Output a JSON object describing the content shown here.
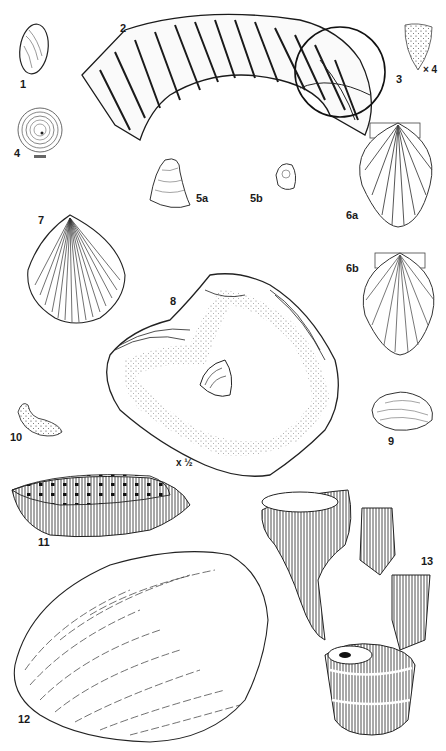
{
  "plate": {
    "background": "#ffffff",
    "ink": "#1a1a1a",
    "figures": [
      {
        "id": "1",
        "label": "1",
        "kind": "oval bivalve shell"
      },
      {
        "id": "2",
        "label": "2",
        "kind": "ribbed ammonite fragment"
      },
      {
        "id": "3",
        "label": "3",
        "kind": "tooth-like fragment",
        "scale": "× 4"
      },
      {
        "id": "4",
        "label": "4",
        "kind": "concentric coiled shell"
      },
      {
        "id": "5a",
        "label": "5a",
        "kind": "conical shell"
      },
      {
        "id": "5b",
        "label": "5b",
        "kind": "small coiled shell"
      },
      {
        "id": "6a",
        "label": "6a",
        "kind": "scallop shell"
      },
      {
        "id": "6b",
        "label": "6b",
        "kind": "scallop shell"
      },
      {
        "id": "7",
        "label": "7",
        "kind": "ribbed bivalve shell"
      },
      {
        "id": "8",
        "label": "8",
        "kind": "oyster shell interior",
        "scale": "x ½"
      },
      {
        "id": "9",
        "label": "9",
        "kind": "small clam shell"
      },
      {
        "id": "10",
        "label": "10",
        "kind": "curved fragment"
      },
      {
        "id": "11",
        "label": "11",
        "kind": "dotted coral fragment"
      },
      {
        "id": "12",
        "label": "12",
        "kind": "oyster shell exterior"
      },
      {
        "id": "13",
        "label": "13",
        "kind": "branching coral"
      }
    ]
  }
}
